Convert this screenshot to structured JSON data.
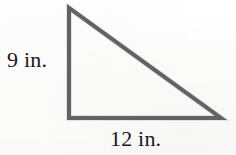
{
  "figure": {
    "kind": "right-triangle-diagram",
    "background_color": "#fdfdfc",
    "stroke_color": "#58585a",
    "stroke_width_px": 4,
    "text_color": "#17171a",
    "shape": {
      "name": "right triangle",
      "vertices": {
        "apex": [
          69,
          8
        ],
        "right_angle": [
          69,
          118
        ],
        "bottom_right": [
          221,
          118
        ]
      },
      "right_angle_at": "bottom-left"
    },
    "labels": {
      "vertical_leg": "9 in.",
      "horizontal_leg": "12 in."
    },
    "measurements": {
      "vertical_leg_value": 9,
      "horizontal_leg_value": 12,
      "units": "in."
    }
  }
}
